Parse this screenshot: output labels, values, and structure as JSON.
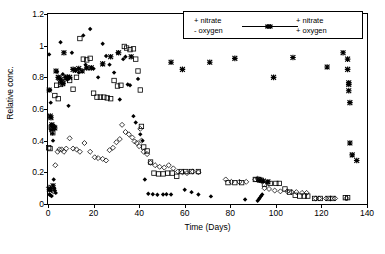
{
  "chart_data": {
    "type": "scatter",
    "title": "",
    "xlabel": "Time (Days)",
    "ylabel": "Relative conc.",
    "xlim": [
      0,
      140
    ],
    "ylim": [
      0,
      1.2
    ],
    "xticks": [
      "0",
      "20",
      "40",
      "60",
      "80",
      "100",
      "120",
      "140"
    ],
    "xtick_values": [
      0,
      20,
      40,
      60,
      80,
      100,
      120,
      140
    ],
    "yticks": [
      "0",
      "0.2",
      "0.4",
      "0.6",
      "0.8",
      "1",
      "1.2"
    ],
    "ytick_values": [
      0,
      0.2,
      0.4,
      0.6,
      0.8,
      1,
      1.2
    ],
    "grid": false,
    "legend_position": "top-right-inside",
    "legend": [
      {
        "label_line1": "+ nitrate",
        "label_line2": "- oxygen",
        "marker": "filled-diamond-and-open-diamond"
      },
      {
        "label_line1": "+ nitrate",
        "label_line2": "+ oxygen",
        "marker": "open-square-and-cross"
      }
    ],
    "series": [
      {
        "name": "+ nitrate - oxygen (A)",
        "marker": "filled-diamond",
        "color": "#000000",
        "points": [
          [
            0.5,
            0.945
          ],
          [
            1.0,
            0.72
          ],
          [
            1.2,
            0.64
          ],
          [
            1.5,
            0.5
          ],
          [
            1.8,
            0.47
          ],
          [
            2.0,
            0.445
          ],
          [
            2.2,
            0.4
          ],
          [
            2.5,
            0.155
          ],
          [
            2.8,
            0.1
          ],
          [
            3.0,
            0.085
          ],
          [
            3.4,
            0.07
          ],
          [
            0.6,
            0.06
          ],
          [
            1.1,
            0.055
          ],
          [
            1.6,
            0.05
          ],
          [
            4.0,
            0.835
          ],
          [
            5.5,
            1.022
          ],
          [
            6.5,
            0.82
          ],
          [
            7.5,
            0.8
          ],
          [
            8.5,
            0.785
          ],
          [
            9.0,
            0.62
          ],
          [
            10.5,
            0.955
          ],
          [
            12.0,
            0.845
          ],
          [
            13.5,
            0.83
          ],
          [
            15.5,
            1.065
          ],
          [
            16.5,
            0.88
          ],
          [
            18.5,
            1.105
          ],
          [
            20.0,
            0.855
          ],
          [
            22.0,
            0.8
          ],
          [
            24.0,
            1.012
          ],
          [
            25.5,
            0.935
          ],
          [
            27.0,
            0.88
          ],
          [
            29.0,
            0.83
          ],
          [
            30.5,
            0.955
          ],
          [
            31.5,
            0.66
          ],
          [
            33.0,
            0.915
          ],
          [
            34.0,
            0.93
          ],
          [
            35.0,
            0.755
          ],
          [
            36.0,
            0.75
          ],
          [
            37.5,
            0.555
          ],
          [
            38.5,
            0.515
          ],
          [
            39.5,
            0.79
          ],
          [
            40.5,
            0.44
          ],
          [
            41.5,
            0.4
          ],
          [
            42.5,
            0.155
          ],
          [
            44.0,
            0.065
          ],
          [
            46.0,
            0.062
          ],
          [
            48.0,
            0.058
          ],
          [
            50.5,
            0.06
          ],
          [
            52.0,
            0.062
          ],
          [
            54.0,
            0.06
          ],
          [
            60.0,
            0.09
          ],
          [
            63.0,
            0.075
          ],
          [
            66.0,
            0.06
          ],
          [
            71.5,
            0.048
          ],
          [
            86.5,
            0.028
          ],
          [
            92.0,
            0.02
          ],
          [
            92.5,
            0.03
          ],
          [
            93.0,
            0.04
          ],
          [
            93.5,
            0.05
          ],
          [
            94.0,
            0.06
          ]
        ]
      },
      {
        "name": "+ nitrate - oxygen (B)",
        "marker": "open-diamond",
        "color": "#000000",
        "points": [
          [
            0.4,
            0.105
          ],
          [
            0.8,
            0.1
          ],
          [
            1.3,
            0.09
          ],
          [
            1.9,
            0.085
          ],
          [
            2.4,
            0.08
          ],
          [
            3.2,
            0.245
          ],
          [
            4.2,
            0.33
          ],
          [
            5.0,
            0.345
          ],
          [
            6.0,
            0.345
          ],
          [
            7.0,
            0.33
          ],
          [
            8.0,
            0.35
          ],
          [
            9.5,
            0.415
          ],
          [
            11.0,
            0.35
          ],
          [
            12.5,
            0.345
          ],
          [
            14.0,
            0.33
          ],
          [
            16.0,
            0.385
          ],
          [
            18.5,
            0.33
          ],
          [
            20.5,
            0.295
          ],
          [
            22.0,
            0.29
          ],
          [
            24.0,
            0.285
          ],
          [
            25.5,
            0.275
          ],
          [
            27.0,
            0.34
          ],
          [
            28.5,
            0.355
          ],
          [
            30.0,
            0.39
          ],
          [
            31.5,
            0.41
          ],
          [
            32.5,
            0.5
          ],
          [
            34.0,
            0.455
          ],
          [
            35.5,
            0.44
          ],
          [
            37.0,
            0.42
          ],
          [
            38.0,
            0.395
          ],
          [
            39.0,
            0.385
          ],
          [
            40.0,
            0.365
          ],
          [
            40.5,
            0.475
          ],
          [
            41.0,
            0.4
          ],
          [
            42.0,
            0.33
          ],
          [
            43.5,
            0.315
          ],
          [
            45.0,
            0.26
          ],
          [
            47.0,
            0.245
          ],
          [
            49.0,
            0.235
          ],
          [
            51.0,
            0.23
          ],
          [
            53.0,
            0.245
          ],
          [
            55.0,
            0.225
          ],
          [
            57.0,
            0.205
          ],
          [
            59.0,
            0.2
          ],
          [
            61.0,
            0.195
          ],
          [
            63.5,
            0.205
          ],
          [
            66.0,
            0.2
          ],
          [
            78.0,
            0.155
          ],
          [
            80.5,
            0.14
          ],
          [
            84.0,
            0.14
          ],
          [
            87.0,
            0.14
          ],
          [
            91.0,
            0.155
          ],
          [
            92.0,
            0.16
          ],
          [
            93.0,
            0.155
          ],
          [
            95.0,
            0.1
          ],
          [
            97.0,
            0.095
          ],
          [
            99.5,
            0.085
          ],
          [
            102.0,
            0.08
          ],
          [
            105.0,
            0.08
          ],
          [
            107.0,
            0.075
          ],
          [
            109.0,
            0.075
          ],
          [
            111.5,
            0.07
          ],
          [
            113.5,
            0.07
          ],
          [
            117.5,
            0.035
          ],
          [
            119.0,
            0.035
          ],
          [
            122.0,
            0.035
          ],
          [
            124.0,
            0.035
          ],
          [
            126.0,
            0.035
          ],
          [
            131.0,
            0.035
          ]
        ]
      },
      {
        "name": "+ nitrate + oxygen (C)",
        "marker": "open-square",
        "color": "#000000",
        "points": [
          [
            0.3,
            0.355
          ],
          [
            0.9,
            0.35
          ],
          [
            1.4,
            0.485
          ],
          [
            1.7,
            0.47
          ],
          [
            2.1,
            0.45
          ],
          [
            3.0,
            0.685
          ],
          [
            3.8,
            0.75
          ],
          [
            4.5,
            0.665
          ],
          [
            5.5,
            0.755
          ],
          [
            6.5,
            0.77
          ],
          [
            8.0,
            0.8
          ],
          [
            9.5,
            0.78
          ],
          [
            11.0,
            0.725
          ],
          [
            12.5,
            0.8
          ],
          [
            14.0,
            1.045
          ],
          [
            15.5,
            0.915
          ],
          [
            17.0,
            0.91
          ],
          [
            18.5,
            0.92
          ],
          [
            20.0,
            0.7
          ],
          [
            21.5,
            0.675
          ],
          [
            23.0,
            0.675
          ],
          [
            24.5,
            0.675
          ],
          [
            26.0,
            0.67
          ],
          [
            27.5,
            0.665
          ],
          [
            29.0,
            0.78
          ],
          [
            30.5,
            0.745
          ],
          [
            32.0,
            0.75
          ],
          [
            33.5,
            0.995
          ],
          [
            34.5,
            0.985
          ],
          [
            36.0,
            0.975
          ],
          [
            37.5,
            0.98
          ],
          [
            38.5,
            0.915
          ],
          [
            39.5,
            0.84
          ],
          [
            40.5,
            0.72
          ],
          [
            41.0,
            0.49
          ],
          [
            42.0,
            0.36
          ],
          [
            43.5,
            0.335
          ],
          [
            45.0,
            0.265
          ],
          [
            46.5,
            0.195
          ],
          [
            48.5,
            0.19
          ],
          [
            50.5,
            0.19
          ],
          [
            52.5,
            0.195
          ],
          [
            54.5,
            0.195
          ],
          [
            56.5,
            0.175
          ],
          [
            58.5,
            0.205
          ],
          [
            60.5,
            0.205
          ],
          [
            63.0,
            0.205
          ],
          [
            66.0,
            0.205
          ],
          [
            79.0,
            0.135
          ],
          [
            82.0,
            0.135
          ],
          [
            85.0,
            0.135
          ],
          [
            91.0,
            0.155
          ],
          [
            92.5,
            0.155
          ],
          [
            93.5,
            0.15
          ],
          [
            95.0,
            0.125
          ],
          [
            97.5,
            0.13
          ],
          [
            100.0,
            0.13
          ],
          [
            101.5,
            0.13
          ],
          [
            104.0,
            0.095
          ],
          [
            106.0,
            0.075
          ],
          [
            108.5,
            0.055
          ],
          [
            110.5,
            0.05
          ],
          [
            112.5,
            0.05
          ],
          [
            114.0,
            0.05
          ],
          [
            117.0,
            0.035
          ],
          [
            119.5,
            0.035
          ],
          [
            123.0,
            0.035
          ],
          [
            125.0,
            0.035
          ],
          [
            130.5,
            0.04
          ],
          [
            131.5,
            0.04
          ]
        ]
      },
      {
        "name": "+ nitrate + oxygen (D)",
        "marker": "cross-asterisk",
        "color": "#000000",
        "points": [
          [
            0.5,
            0.72
          ],
          [
            1.0,
            0.555
          ],
          [
            1.3,
            0.545
          ],
          [
            1.7,
            0.5
          ],
          [
            2.0,
            0.49
          ],
          [
            2.6,
            0.485
          ],
          [
            3.0,
            0.48
          ],
          [
            2.2,
            0.115
          ],
          [
            1.0,
            0.095
          ],
          [
            0.6,
            0.09
          ],
          [
            3.5,
            0.84
          ],
          [
            4.5,
            0.8
          ],
          [
            5.0,
            0.795
          ],
          [
            5.5,
            0.785
          ],
          [
            6.0,
            0.77
          ],
          [
            6.5,
            0.76
          ],
          [
            7.0,
            0.955
          ],
          [
            8.5,
            0.8
          ],
          [
            9.5,
            0.8
          ],
          [
            11.0,
            0.85
          ],
          [
            12.0,
            0.845
          ],
          [
            13.5,
            0.855
          ],
          [
            15.0,
            0.84
          ],
          [
            17.0,
            0.86
          ],
          [
            19.0,
            0.86
          ],
          [
            24.0,
            0.885
          ],
          [
            27.5,
            0.93
          ],
          [
            31.0,
            0.955
          ],
          [
            36.5,
            0.93
          ],
          [
            54.0,
            0.895
          ],
          [
            59.0,
            0.85
          ],
          [
            71.0,
            0.895
          ],
          [
            82.0,
            0.92
          ],
          [
            93.0,
            0.15
          ],
          [
            94.5,
            0.145
          ],
          [
            96.5,
            0.14
          ],
          [
            99.0,
            0.8
          ],
          [
            107.5,
            0.925
          ],
          [
            122.5,
            0.865
          ],
          [
            129.5,
            0.955
          ],
          [
            131.5,
            0.915
          ],
          [
            131.5,
            0.85
          ],
          [
            132.0,
            0.765
          ],
          [
            132.0,
            0.755
          ],
          [
            132.0,
            0.715
          ],
          [
            132.5,
            0.64
          ],
          [
            132.5,
            0.385
          ],
          [
            133.5,
            0.31
          ],
          [
            135.5,
            0.275
          ]
        ]
      }
    ]
  }
}
